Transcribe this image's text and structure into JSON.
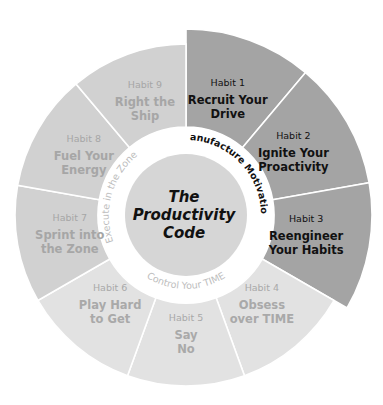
{
  "diagram": {
    "center": {
      "lines": [
        "The",
        "Productivity",
        "Code"
      ],
      "fill": "#d6d6d6",
      "text_color": "#111111"
    },
    "ring_labels": [
      {
        "id": "manufacture",
        "text": "Manufacture Motivation",
        "color": "#111111",
        "bold": true
      },
      {
        "id": "control",
        "text": "Control Your TIME",
        "color": "#bdbdbd",
        "bold": false
      },
      {
        "id": "execute",
        "text": "Execute in the Zone",
        "color": "#bdbdbd",
        "bold": false
      }
    ],
    "habits": [
      {
        "num": "Habit 1",
        "title": [
          "Recruit Your",
          "Drive"
        ],
        "group": "manufacture"
      },
      {
        "num": "Habit 2",
        "title": [
          "Ignite Your",
          "Proactivity"
        ],
        "group": "manufacture"
      },
      {
        "num": "Habit 3",
        "title": [
          "Reengineer",
          "Your Habits"
        ],
        "group": "manufacture"
      },
      {
        "num": "Habit 4",
        "title": [
          "Obsess",
          "over TIME"
        ],
        "group": "control"
      },
      {
        "num": "Habit 5",
        "title": [
          "Say",
          "No"
        ],
        "group": "control"
      },
      {
        "num": "Habit 6",
        "title": [
          "Play Hard",
          "to Get"
        ],
        "group": "control"
      },
      {
        "num": "Habit 7",
        "title": [
          "Sprint into",
          "the Zone"
        ],
        "group": "execute"
      },
      {
        "num": "Habit 8",
        "title": [
          "Fuel Your",
          "Energy"
        ],
        "group": "execute"
      },
      {
        "num": "Habit 9",
        "title": [
          "Right the",
          "Ship"
        ],
        "group": "execute"
      }
    ],
    "groups": {
      "manufacture": {
        "fill": "#a4a4a4",
        "text": "#111111",
        "outer_r": 186
      },
      "control": {
        "fill": "#e2e2e2",
        "text": "#a9a9a9",
        "outer_r": 171
      },
      "execute": {
        "fill": "#d1d1d1",
        "text": "#a6a6a6",
        "outer_r": 171
      }
    }
  }
}
